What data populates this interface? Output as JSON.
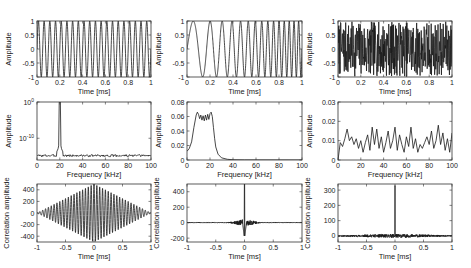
{
  "figure": {
    "width": 471,
    "height": 268,
    "line_color": "#1a1a1a",
    "axis_color": "#333333",
    "background": "#ffffff"
  },
  "chart_data": [
    {
      "id": "p11",
      "type": "line",
      "row": 0,
      "col": 0,
      "signal": "sine",
      "box": [
        37,
        21,
        114,
        56
      ],
      "xlabel": "Time [ms]",
      "ylabel": "Amplitude",
      "xlim": [
        0,
        1
      ],
      "ylim": [
        -1,
        1
      ],
      "xticks": [
        0,
        0.2,
        0.4,
        0.6,
        0.8,
        1
      ],
      "xticklabels": [
        "0",
        "0.2",
        "0.4",
        "0.6",
        "0.8",
        "1"
      ],
      "yticks": [
        -1,
        -0.5,
        0,
        0.5,
        1
      ],
      "yticklabels": [
        "-1",
        "-0.5",
        "0",
        "0.5",
        "1"
      ],
      "description": "Pure sinusoid, 20 kHz, ~20 cycles over 1 ms",
      "params": {
        "freq_khz": 20
      }
    },
    {
      "id": "p12",
      "type": "line",
      "row": 0,
      "col": 1,
      "signal": "chirp",
      "box": [
        187,
        21,
        115,
        56
      ],
      "xlabel": "Time [ms]",
      "ylabel": "Amplitude",
      "xlim": [
        0,
        1
      ],
      "ylim": [
        -1,
        1
      ],
      "xticks": [
        0,
        0.2,
        0.4,
        0.6,
        0.8,
        1
      ],
      "xticklabels": [
        "0",
        "0.2",
        "0.4",
        "0.6",
        "0.8",
        "1"
      ],
      "yticks": [
        -1,
        -0.5,
        0,
        0.5,
        1
      ],
      "yticklabels": [
        "-1",
        "-0.5",
        "0",
        "0.5",
        "1"
      ],
      "description": "Linear chirp sweeping ~5 kHz to ~25 kHz over 1 ms",
      "params": {
        "f0_khz": 4,
        "f1_khz": 26
      }
    },
    {
      "id": "p13",
      "type": "line",
      "row": 0,
      "col": 2,
      "signal": "noise",
      "box": [
        338,
        21,
        114,
        56
      ],
      "xlabel": "Time [ms]",
      "ylabel": "Amplitude",
      "xlim": [
        0,
        1
      ],
      "ylim": [
        -1,
        1
      ],
      "xticks": [
        0,
        0.2,
        0.4,
        0.6,
        0.8,
        1
      ],
      "xticklabels": [
        "0",
        "0.2",
        "0.4",
        "0.6",
        "0.8",
        "1"
      ],
      "yticks": [
        -1,
        -0.5,
        0,
        0.5,
        1
      ],
      "yticklabels": [
        "-1",
        "-0.5",
        "0",
        "0.5",
        "1"
      ],
      "description": "Random (white) noise between -1 and 1",
      "params": {
        "seed": 7,
        "n": 400
      }
    },
    {
      "id": "p21",
      "type": "line",
      "row": 1,
      "col": 0,
      "signal": "spectrum_peak",
      "box": [
        37,
        102,
        114,
        58
      ],
      "xlabel": "Frequency [kHz]",
      "ylabel": "Amplitude",
      "xlim": [
        0,
        100
      ],
      "yscale": "log",
      "ylim_exp": [
        -16,
        0
      ],
      "xticks": [
        0,
        20,
        40,
        60,
        80,
        100
      ],
      "xticklabels": [
        "0",
        "20",
        "40",
        "60",
        "80",
        "100"
      ],
      "yticks_exp": [
        0,
        -10
      ],
      "yticklabels": [
        "10^0",
        "10^-10"
      ],
      "description": "Log-amplitude spectrum with single sharp peak at 20 kHz, noise floor near 10^-15",
      "params": {
        "peak_khz": 20,
        "floor_exp": -14.8
      }
    },
    {
      "id": "p22",
      "type": "line",
      "row": 1,
      "col": 1,
      "signal": "spectrum_band",
      "box": [
        187,
        102,
        115,
        58
      ],
      "xlabel": "Frequency [kHz]",
      "ylabel": "Amplitude",
      "xlim": [
        0,
        100
      ],
      "ylim": [
        0,
        0.08
      ],
      "xticks": [
        0,
        20,
        40,
        60,
        80,
        100
      ],
      "xticklabels": [
        "0",
        "20",
        "40",
        "60",
        "80",
        "100"
      ],
      "yticks": [
        0,
        0.02,
        0.04,
        0.06,
        0.08
      ],
      "yticklabels": [
        "0",
        "0.02",
        "0.04",
        "0.06",
        "0.08"
      ],
      "description": "Band-limited chirp spectrum, flat ~0.06 with ripples between ~7-23 kHz, starts ~0.012 at 0",
      "x": [
        0,
        2,
        4,
        6,
        8,
        9,
        10,
        11,
        12,
        13,
        14,
        15,
        16,
        17,
        18,
        19,
        20,
        21,
        22,
        23,
        24,
        25,
        27,
        30,
        35,
        40,
        50,
        100
      ],
      "values": [
        0.012,
        0.016,
        0.025,
        0.045,
        0.062,
        0.066,
        0.063,
        0.057,
        0.062,
        0.055,
        0.061,
        0.054,
        0.062,
        0.055,
        0.063,
        0.056,
        0.064,
        0.066,
        0.06,
        0.045,
        0.03,
        0.018,
        0.008,
        0.003,
        0.001,
        0.0003,
        0.0001,
        0.0
      ]
    },
    {
      "id": "p23",
      "type": "line",
      "row": 1,
      "col": 2,
      "signal": "spectrum_noise",
      "box": [
        338,
        102,
        114,
        58
      ],
      "xlabel": "Frequency [kHz]",
      "ylabel": "Amplitude",
      "xlim": [
        0,
        100
      ],
      "ylim": [
        0,
        0.03
      ],
      "xticks": [
        0,
        20,
        40,
        60,
        80,
        100
      ],
      "xticklabels": [
        "0",
        "20",
        "40",
        "60",
        "80",
        "100"
      ],
      "yticks": [
        0,
        0.01,
        0.02,
        0.03
      ],
      "yticklabels": [
        "0",
        "0.01",
        "0.02",
        "0.03"
      ],
      "description": "Noisy flat spectrum fluctuating ~0.003-0.018",
      "x": [
        0,
        2,
        4,
        6,
        8,
        10,
        12,
        14,
        16,
        18,
        20,
        22,
        24,
        26,
        28,
        30,
        32,
        34,
        36,
        38,
        40,
        42,
        44,
        46,
        48,
        50,
        52,
        54,
        56,
        58,
        60,
        62,
        64,
        66,
        68,
        70,
        72,
        74,
        76,
        78,
        80,
        82,
        84,
        86,
        88,
        90,
        92,
        94,
        96,
        98,
        100
      ],
      "values": [
        0.0,
        0.009,
        0.007,
        0.011,
        0.016,
        0.01,
        0.012,
        0.008,
        0.011,
        0.006,
        0.01,
        0.004,
        0.009,
        0.013,
        0.005,
        0.017,
        0.008,
        0.016,
        0.006,
        0.012,
        0.004,
        0.009,
        0.015,
        0.006,
        0.01,
        0.017,
        0.005,
        0.013,
        0.008,
        0.004,
        0.012,
        0.007,
        0.017,
        0.006,
        0.011,
        0.004,
        0.008,
        0.006,
        0.009,
        0.012,
        0.008,
        0.015,
        0.006,
        0.01,
        0.018,
        0.008,
        0.014,
        0.005,
        0.011,
        0.004,
        0.014
      ]
    },
    {
      "id": "p31",
      "type": "line",
      "row": 2,
      "col": 0,
      "signal": "autocorr_sine",
      "box": [
        37,
        184,
        114,
        58
      ],
      "xlabel": "Time [ms]",
      "ylabel": "Correlation amplitude",
      "xlim": [
        -1,
        1
      ],
      "ylim": [
        -500,
        500
      ],
      "xticks": [
        -1,
        -0.5,
        0,
        0.5,
        1
      ],
      "xticklabels": [
        "-1",
        "-0.5",
        "0",
        "0.5",
        "1"
      ],
      "yticks": [
        -400,
        -200,
        0,
        200,
        400
      ],
      "yticklabels": [
        "-400",
        "-200",
        "0",
        "200",
        "400"
      ],
      "description": "Autocorrelation of sine: oscillation at 20 kHz with triangular envelope peaking ~500 at lag 0",
      "params": {
        "freq_khz": 20,
        "peak": 500
      }
    },
    {
      "id": "p32",
      "type": "line",
      "row": 2,
      "col": 1,
      "signal": "autocorr_chirp",
      "box": [
        187,
        184,
        115,
        58
      ],
      "xlabel": "Time [ms]",
      "ylabel": "Correlation amplitude",
      "xlim": [
        -1,
        1
      ],
      "ylim": [
        -250,
        500
      ],
      "xticks": [
        -1,
        -0.5,
        0,
        0.5,
        1
      ],
      "xticklabels": [
        "-1",
        "-0.5",
        "0",
        "0.5",
        "1"
      ],
      "yticks": [
        -200,
        0,
        200,
        400
      ],
      "yticklabels": [
        "-200",
        "0",
        "200",
        "400"
      ],
      "description": "Autocorrelation of chirp: sharp peak ~500 at 0, sidelobes to ~-230, small ripples elsewhere",
      "params": {
        "peak": 500
      }
    },
    {
      "id": "p33",
      "type": "line",
      "row": 2,
      "col": 2,
      "signal": "autocorr_noise",
      "box": [
        338,
        184,
        114,
        58
      ],
      "xlabel": "Time [ms]",
      "ylabel": "Correlation amplitude",
      "xlim": [
        -1,
        1
      ],
      "ylim": [
        -40,
        340
      ],
      "xticks": [
        -1,
        -0.5,
        0,
        0.5,
        1
      ],
      "xticklabels": [
        "-1",
        "-0.5",
        "0",
        "0.5",
        "1"
      ],
      "yticks": [
        0,
        100,
        200,
        300
      ],
      "yticklabels": [
        "0",
        "100",
        "200",
        "300"
      ],
      "description": "Autocorrelation of noise: single delta peak ~330 at lag 0, low noisy floor ±15",
      "params": {
        "peak": 330,
        "seed": 11
      }
    }
  ]
}
